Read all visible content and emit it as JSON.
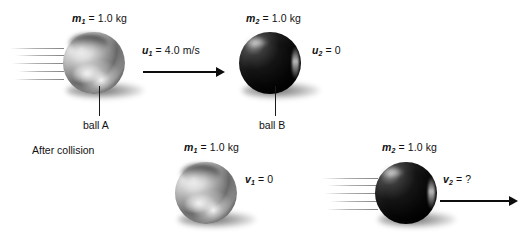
{
  "figure": {
    "section_label": "After collision",
    "accent_color": "#0d0d0d",
    "background": "#ffffff"
  },
  "before": {
    "ball_a": {
      "caption": "ball A",
      "mass_var": "m",
      "mass_sub": "1",
      "mass_value": "= 1.0 kg",
      "velocity_var": "u",
      "velocity_sub": "1",
      "velocity_value": "= 4.0 m/s",
      "color": "silver",
      "moving": true
    },
    "ball_b": {
      "caption": "ball B",
      "mass_var": "m",
      "mass_sub": "2",
      "mass_value": "= 1.0 kg",
      "velocity_var": "u",
      "velocity_sub": "2",
      "velocity_value": "= 0",
      "color": "black",
      "moving": false
    }
  },
  "after": {
    "ball_a": {
      "mass_var": "m",
      "mass_sub": "1",
      "mass_value": "= 1.0 kg",
      "velocity_var": "v",
      "velocity_sub": "1",
      "velocity_value": "= 0",
      "color": "silver",
      "moving": false
    },
    "ball_b": {
      "mass_var": "m",
      "mass_sub": "2",
      "mass_value": "= 1.0 kg",
      "velocity_var": "v",
      "velocity_sub": "2",
      "velocity_value": "= ?",
      "color": "black",
      "moving": true
    }
  }
}
